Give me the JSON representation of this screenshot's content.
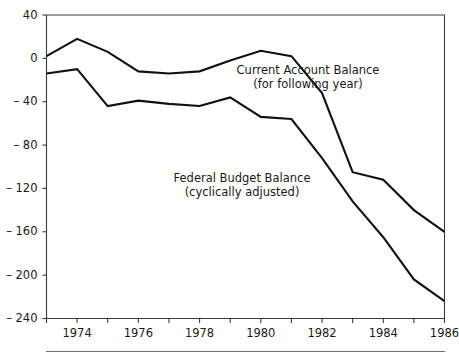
{
  "chart_data": {
    "type": "line",
    "title": "",
    "subtitle": "",
    "xlabel": "",
    "ylabel": "",
    "xlim": [
      1973,
      1986
    ],
    "ylim": [
      -240,
      40
    ],
    "grid": false,
    "legend_position": "inline-annotations",
    "x": [
      1973,
      1974,
      1975,
      1976,
      1977,
      1978,
      1979,
      1980,
      1981,
      1982,
      1983,
      1984,
      1985,
      1986
    ],
    "xticks": [
      1973,
      1974,
      1975,
      1976,
      1977,
      1978,
      1979,
      1980,
      1981,
      1982,
      1983,
      1984,
      1985,
      1986
    ],
    "xtick_labels": [
      "1974",
      "1976",
      "1978",
      "1980",
      "1982",
      "1984",
      "1986"
    ],
    "xtick_label_values": [
      1974,
      1976,
      1978,
      1980,
      1982,
      1984,
      1986
    ],
    "yticks": [
      40,
      0,
      -40,
      -80,
      -120,
      -160,
      -200,
      -240
    ],
    "ytick_labels": [
      "40",
      "0",
      "– 40",
      "– 80",
      "– 120",
      "– 160",
      "– 200",
      "– 240"
    ],
    "series": [
      {
        "name": "Current Account Balance",
        "annotation_line1": "Current Account Balance",
        "annotation_line2": "(for following year)",
        "color": "#111111",
        "values": [
          2,
          18,
          6,
          -12,
          -14,
          -12,
          -2,
          7,
          2,
          -32,
          -105,
          -112,
          -140,
          -160
        ]
      },
      {
        "name": "Federal Budget Balance",
        "annotation_line1": "Federal Budget Balance",
        "annotation_line2": "(cyclically adjusted)",
        "color": "#111111",
        "values": [
          -14,
          -10,
          -44,
          -39,
          -42,
          -44,
          -36,
          -54,
          -56,
          -92,
          -132,
          -165,
          -204,
          -224
        ]
      }
    ],
    "annotations": [
      {
        "name": "current-account-balance-label",
        "line1": "Current Account Balance",
        "line2": "(for following year)",
        "x_px": 308,
        "y_px": 74
      },
      {
        "name": "federal-budget-balance-label",
        "line1": "Federal Budget Balance",
        "line2": "(cyclically adjusted)",
        "x_px": 185,
        "y_px": 182
      }
    ]
  }
}
